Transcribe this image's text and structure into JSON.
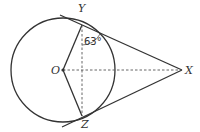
{
  "diagram": {
    "type": "geometry",
    "colors": {
      "stroke": "#333333",
      "background": "#ffffff"
    },
    "points": {
      "O": {
        "label": "O"
      },
      "Y": {
        "label": "Y"
      },
      "Z": {
        "label": "Z"
      },
      "X": {
        "label": "X"
      }
    },
    "angle": {
      "vertex": "Y",
      "between": [
        "YZ",
        "YX"
      ],
      "label": "63°"
    },
    "segments": {
      "solid": [
        "OY",
        "OZ",
        "YX",
        "ZX"
      ],
      "dashed": [
        "YZ",
        "OX"
      ]
    }
  }
}
